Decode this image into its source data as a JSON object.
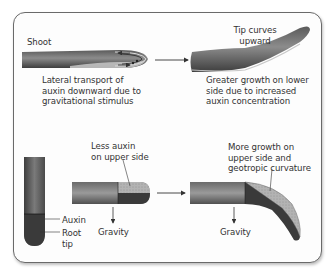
{
  "diagram": {
    "type": "gravitropism-auxin",
    "colors": {
      "tissue_dark": "#4a4a4a",
      "tissue_mid": "#8a8a8a",
      "tissue_light": "#b5b5b5",
      "auxin_region": "#3a3a3a",
      "low_auxin_region": "#b0b0b0",
      "frame_border": "#6a6a6a",
      "text": "#333333"
    },
    "panels": {
      "shoot_before": {
        "title": "Shoot",
        "caption": "Lateral transport of\nauxin downward due to\ngravitational stimulus"
      },
      "shoot_after": {
        "title": "Tip curves\nupward",
        "caption": "Greater growth on lower\nside due to increased\nauxin concentration"
      },
      "root_vertical": {
        "label_auxin": "Auxin",
        "label_root_tip": "Root\ntip"
      },
      "root_horizontal": {
        "title": "Less auxin\non upper side",
        "gravity_label": "Gravity"
      },
      "root_bent": {
        "title": "More growth on\nupper side and\ngeotropic curvature",
        "gravity_label": "Gravity"
      }
    }
  }
}
